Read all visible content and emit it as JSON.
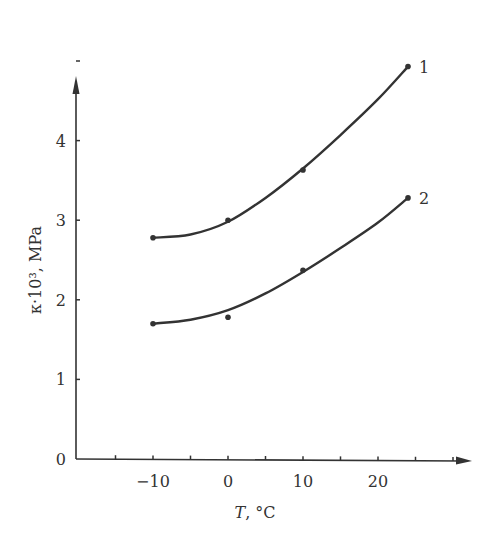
{
  "chart_data": {
    "type": "line",
    "title": "",
    "xlabel": "T, °C",
    "xlabel_italic_part": "T",
    "xlabel_rest": ", °C",
    "ylabel": "κ·10³, MPa",
    "xlim": [
      -20,
      32
    ],
    "ylim": [
      0,
      5.2
    ],
    "x_ticks": [
      -15,
      -10,
      -5,
      0,
      5,
      10,
      15,
      20,
      25,
      30
    ],
    "x_tick_labels": [
      {
        "value": -10,
        "label": "−10"
      },
      {
        "value": 0,
        "label": "0"
      },
      {
        "value": 10,
        "label": "10"
      },
      {
        "value": 20,
        "label": "20"
      }
    ],
    "y_ticks": [
      0,
      1,
      2,
      3,
      4,
      5
    ],
    "y_tick_labels": [
      {
        "value": 0,
        "label": "0"
      },
      {
        "value": 1,
        "label": "1"
      },
      {
        "value": 2,
        "label": "2"
      },
      {
        "value": 3,
        "label": "3"
      },
      {
        "value": 4,
        "label": "4"
      }
    ],
    "grid": false,
    "legend": "inline labels at curve ends",
    "series": [
      {
        "name": "1",
        "points": [
          {
            "x": -10,
            "y": 2.78
          },
          {
            "x": 0,
            "y": 3.0
          },
          {
            "x": 10,
            "y": 3.63
          },
          {
            "x": 24,
            "y": 4.93
          }
        ],
        "curve": [
          {
            "x": -10,
            "y": 2.78
          },
          {
            "x": -5,
            "y": 2.82
          },
          {
            "x": 0,
            "y": 2.98
          },
          {
            "x": 5,
            "y": 3.28
          },
          {
            "x": 10,
            "y": 3.65
          },
          {
            "x": 15,
            "y": 4.07
          },
          {
            "x": 20,
            "y": 4.52
          },
          {
            "x": 24,
            "y": 4.93
          }
        ]
      },
      {
        "name": "2",
        "points": [
          {
            "x": -10,
            "y": 1.7
          },
          {
            "x": 0,
            "y": 1.78
          },
          {
            "x": 10,
            "y": 2.37
          },
          {
            "x": 24,
            "y": 3.28
          }
        ],
        "curve": [
          {
            "x": -10,
            "y": 1.7
          },
          {
            "x": -5,
            "y": 1.75
          },
          {
            "x": 0,
            "y": 1.87
          },
          {
            "x": 5,
            "y": 2.08
          },
          {
            "x": 10,
            "y": 2.35
          },
          {
            "x": 15,
            "y": 2.65
          },
          {
            "x": 20,
            "y": 2.97
          },
          {
            "x": 24,
            "y": 3.28
          }
        ]
      }
    ]
  }
}
